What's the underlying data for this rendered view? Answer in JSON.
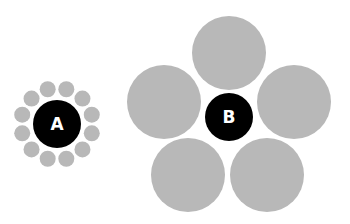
{
  "colors": {
    "surround": "#b8b8b8",
    "center": "#000000",
    "label": "#ffffff",
    "background": "#ffffff"
  },
  "figure_a": {
    "label": "A",
    "center": [
      57,
      124
    ],
    "center_radius": 24,
    "surround_count": 12,
    "surround_radius": 8,
    "ring_radius": 36
  },
  "figure_b": {
    "label": "B",
    "center": [
      229,
      117
    ],
    "center_radius": 24,
    "surround_count": 5,
    "surround_radius": 37,
    "surround_centers": [
      [
        229,
        53
      ],
      [
        294,
        102
      ],
      [
        267,
        175
      ],
      [
        188,
        175
      ],
      [
        164,
        102
      ]
    ]
  }
}
